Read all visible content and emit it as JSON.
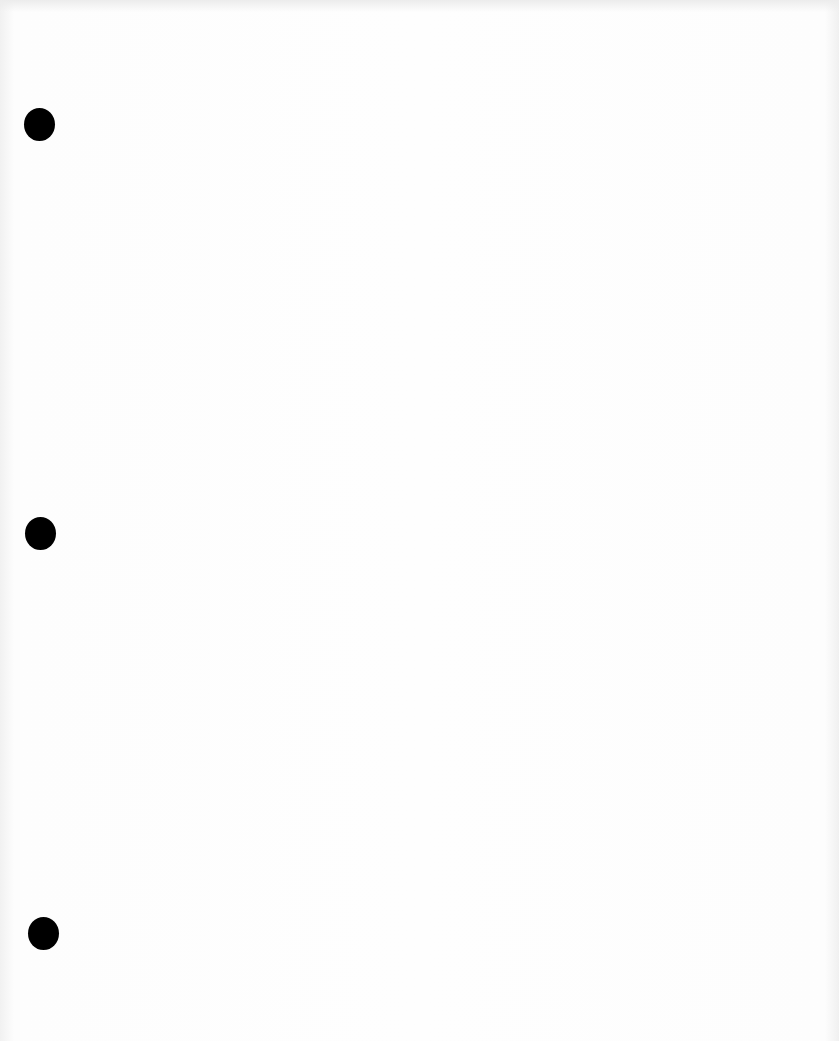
{
  "page": {
    "type": "blank scanned sheet",
    "background_color": "#fdfdfd",
    "text": ""
  },
  "holes": [
    {
      "cx": 39,
      "cy": 124
    },
    {
      "cx": 40,
      "cy": 533
    },
    {
      "cx": 43,
      "cy": 933
    }
  ]
}
